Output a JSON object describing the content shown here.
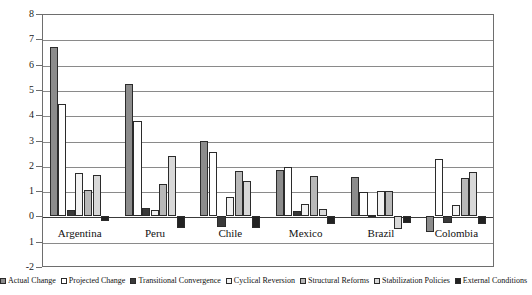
{
  "chart_data": {
    "type": "bar",
    "title": "",
    "subtitle": "",
    "xlabel": "",
    "ylabel": "",
    "ylim": [
      -2,
      8
    ],
    "yticks": [
      -2,
      -1,
      0,
      1,
      2,
      3,
      4,
      5,
      6,
      7,
      8
    ],
    "ytick_labels": [
      "-2",
      "1",
      "0",
      "1",
      "2",
      "3",
      "4",
      "5",
      "6",
      "7",
      "8"
    ],
    "grid": true,
    "legend_position": "bottom",
    "categories": [
      "Argentina",
      "Peru",
      "Chile",
      "Mexico",
      "Brazil",
      "Colombia"
    ],
    "series": [
      {
        "name": "Actual Change",
        "color": "#8c8c8c",
        "values": [
          6.7,
          5.25,
          3.0,
          1.85,
          1.55,
          -0.6
        ]
      },
      {
        "name": "Projected Change",
        "color": "#ffffff",
        "values": [
          4.45,
          3.78,
          2.55,
          1.95,
          0.95,
          2.25
        ]
      },
      {
        "name": "Transitional Convergence",
        "color": "#3a3a3a",
        "values": [
          0.25,
          0.35,
          -0.4,
          0.2,
          0.05,
          -0.25
        ]
      },
      {
        "name": "Cyclical Reversion",
        "color": "#f2f2f2",
        "values": [
          1.7,
          0.25,
          0.75,
          0.5,
          1.0,
          0.45
        ]
      },
      {
        "name": "Structural Reforms",
        "color": "#b8b8b8",
        "values": [
          1.05,
          1.3,
          1.8,
          1.6,
          1.0,
          1.5
        ]
      },
      {
        "name": "Stabilization Policies",
        "color": "#d8d8d8",
        "values": [
          1.65,
          2.4,
          1.4,
          0.3,
          -0.5,
          1.75
        ]
      },
      {
        "name": "External Conditions",
        "color": "#222222",
        "values": [
          -0.2,
          -0.45,
          -0.45,
          -0.3,
          -0.25,
          -0.3
        ]
      }
    ]
  },
  "legend": {
    "items": [
      {
        "label": "Actual Change"
      },
      {
        "label": "Projected Change"
      },
      {
        "label": "Transitional Convergence"
      },
      {
        "label": "Cyclical Reversion"
      },
      {
        "label": "Structural Reforms"
      },
      {
        "label": "Stabilization Policies"
      },
      {
        "label": "External Conditions"
      }
    ]
  }
}
